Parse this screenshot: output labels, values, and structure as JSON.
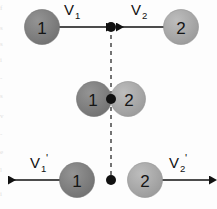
{
  "figure": {
    "background_color": "#fdfdfd",
    "width": 217,
    "height": 209
  },
  "colors": {
    "ball_one_fill": "#7d7d7d",
    "ball_two_fill": "#a8a8a8",
    "ball_stroke": "#6e6e6e",
    "line_color": "#1a1a1a",
    "dashed_line_color": "#2b2b2b",
    "dot_color": "#111111",
    "label_color": "#111111"
  },
  "rows": {
    "before": {
      "name": "before-collision-row",
      "ball_left": {
        "label": "1",
        "fill": "#7d7d7d"
      },
      "ball_right": {
        "label": "2",
        "fill": "#a8a8a8"
      },
      "velocity_left": {
        "symbol": "V",
        "subscript": "1",
        "prime": "",
        "direction": "right"
      },
      "velocity_right": {
        "symbol": "V",
        "subscript": "2",
        "prime": "",
        "direction": "left"
      },
      "contact_dot": "collision-point"
    },
    "during": {
      "name": "contact-row",
      "ball_left": {
        "label": "1",
        "fill": "#7d7d7d"
      },
      "ball_right": {
        "label": "2",
        "fill": "#a8a8a8"
      },
      "contact_dot": "contact-point"
    },
    "after": {
      "name": "after-collision-row",
      "ball_left": {
        "label": "1",
        "fill": "#7d7d7d"
      },
      "ball_right": {
        "label": "2",
        "fill": "#a8a8a8"
      },
      "velocity_left": {
        "symbol": "V",
        "subscript": "1",
        "prime": "'",
        "direction": "left"
      },
      "velocity_right": {
        "symbol": "V",
        "subscript": "2",
        "prime": "'",
        "direction": "right"
      },
      "contact_dot": "separation-point"
    }
  },
  "labels": {
    "v1": "V",
    "v1_sub": "1",
    "v2": "V",
    "v2_sub": "2",
    "v1_prime": "V",
    "v1_prime_sub": "1",
    "v1_prime_mark": "'",
    "v2_prime": "V",
    "v2_prime_sub": "2",
    "v2_prime_mark": "'",
    "ball_one": "1",
    "ball_two": "2"
  },
  "axis": {
    "name": "collision-axis",
    "style": "dashed-vertical"
  },
  "edge_artifacts": [
    "f",
    "s",
    "s",
    "i",
    "-",
    "s",
    "v",
    "-",
    "e",
    "l",
    "i"
  ]
}
